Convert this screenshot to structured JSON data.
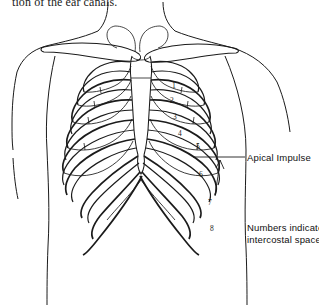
{
  "page": {
    "top_caption": "tion of the ear canals.",
    "background_color": "#ffffff",
    "ink_color": "#1b1b1b"
  },
  "figure": {
    "annotations": {
      "apical_impulse": "Apical Impulse",
      "legend_line_1": "Numbers indicate",
      "legend_line_2": "intercostal spaces"
    },
    "intercostal_numbers": [
      {
        "label": "1",
        "x": 172,
        "y": 88
      },
      {
        "label": "2",
        "x": 170,
        "y": 103
      },
      {
        "label": "3",
        "x": 173,
        "y": 119
      },
      {
        "label": "4",
        "x": 178,
        "y": 136
      },
      {
        "label": "5",
        "x": 196,
        "y": 149
      },
      {
        "label": "6",
        "x": 199,
        "y": 177
      },
      {
        "label": "7",
        "x": 208,
        "y": 205
      },
      {
        "label": "8",
        "x": 210,
        "y": 231
      }
    ]
  }
}
